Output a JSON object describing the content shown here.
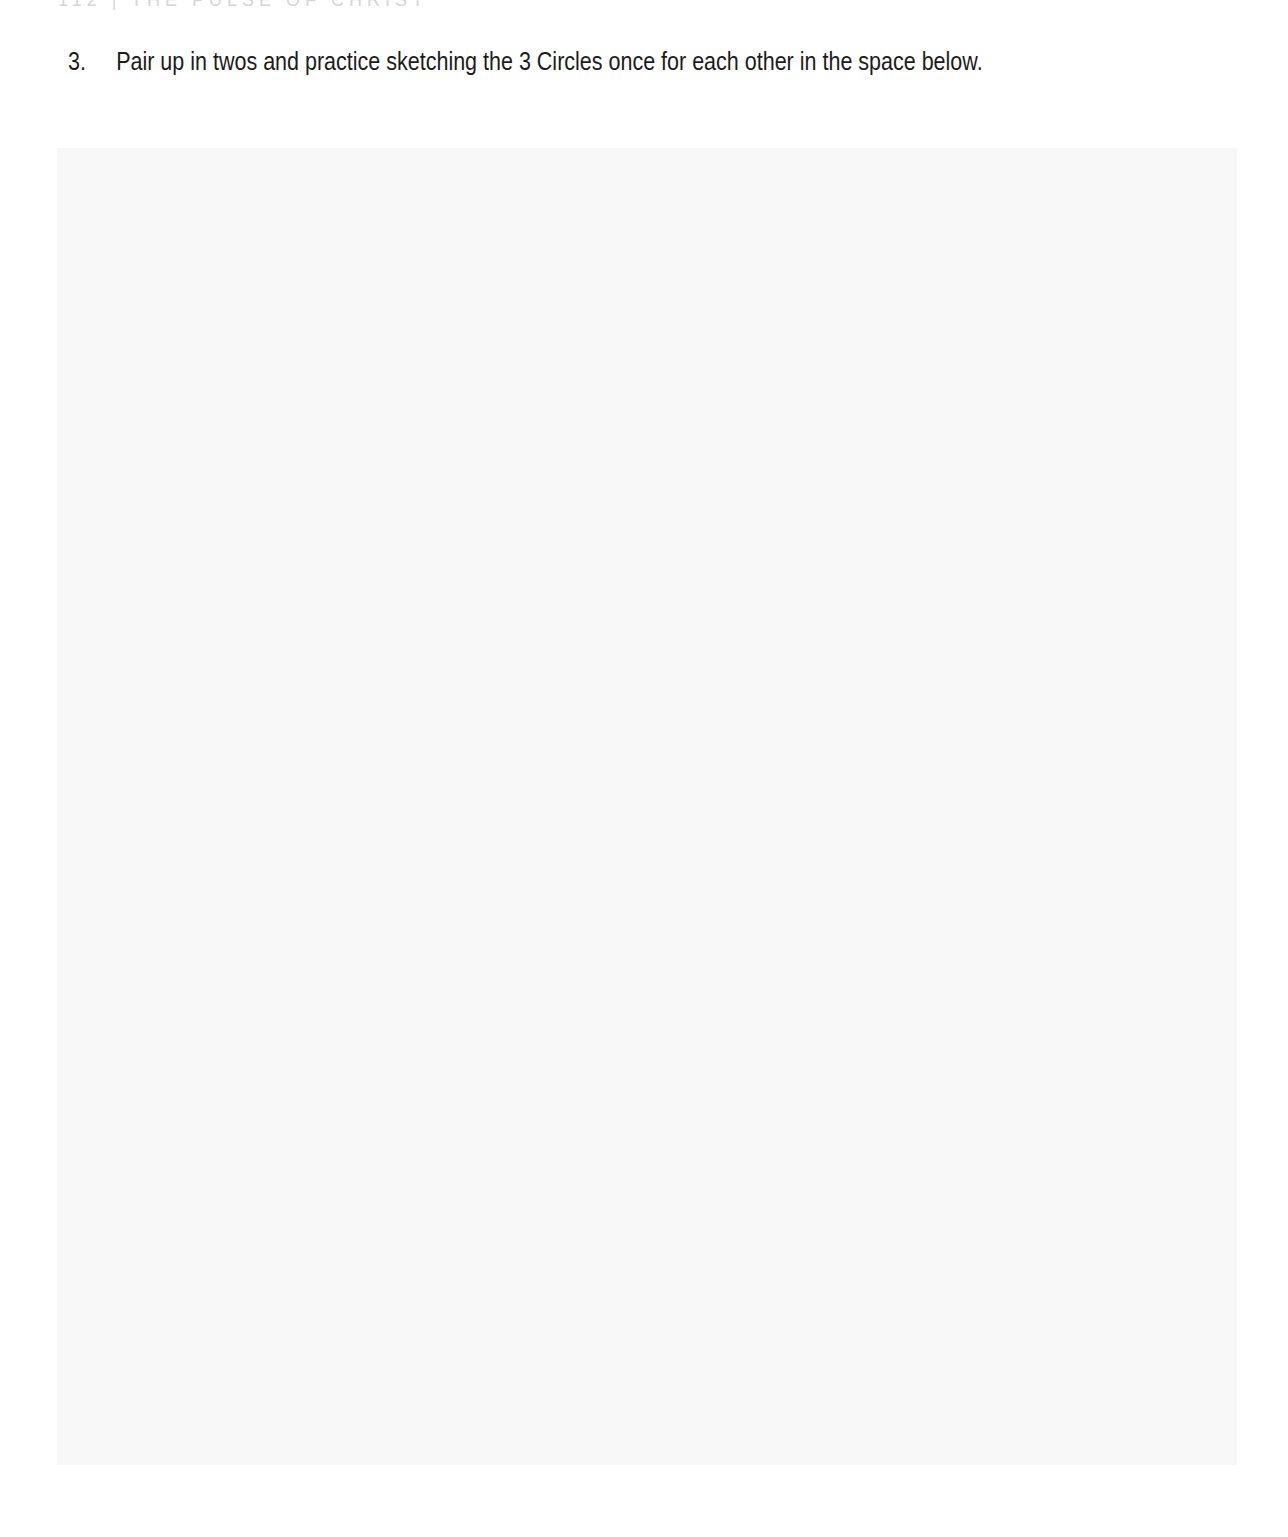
{
  "page": {
    "running_header": "112 | THE PULSE OF CHRIST"
  },
  "question": {
    "number": "3.",
    "text": "Pair up in twos and practice sketching the 3 Circles once for each other in the space below."
  },
  "sketch_area": {
    "fill_color": "#f8f8f8",
    "label": ""
  }
}
